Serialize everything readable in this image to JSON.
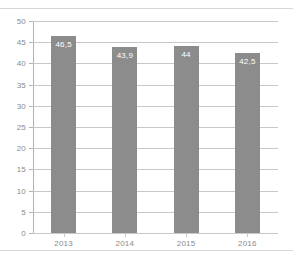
{
  "chart_data": {
    "type": "bar",
    "title": "",
    "subtitle": "",
    "xlabel": "",
    "ylabel": "",
    "categories": [
      "2013",
      "2014",
      "2015",
      "2016"
    ],
    "values": [
      46.5,
      43.9,
      44,
      42.5
    ],
    "value_labels": [
      "46,5",
      "43,9",
      "44",
      "42,5"
    ],
    "ylim": [
      0,
      50
    ],
    "ytick_step": 5,
    "ytick_labels": [
      "50",
      "45",
      "40",
      "35",
      "30",
      "25",
      "20",
      "15",
      "10",
      "5",
      "0"
    ],
    "ytick_values": [
      50,
      45,
      40,
      35,
      30,
      25,
      20,
      15,
      10,
      5,
      0
    ],
    "grid": true,
    "grid_orientation": "horizontal",
    "legend": false,
    "legend_position": "none",
    "series": [
      {
        "name": "",
        "values": [
          46.5,
          43.9,
          44,
          42.5
        ]
      }
    ],
    "colors": {
      "bar": "#8c8c8c",
      "grid": "#c8c8c8",
      "axis": "#b4b4b4",
      "tick_text": "#8a8a8a",
      "value_text": "#ffffff",
      "background": "#ffffff",
      "rule": "#d6d6d6"
    }
  }
}
